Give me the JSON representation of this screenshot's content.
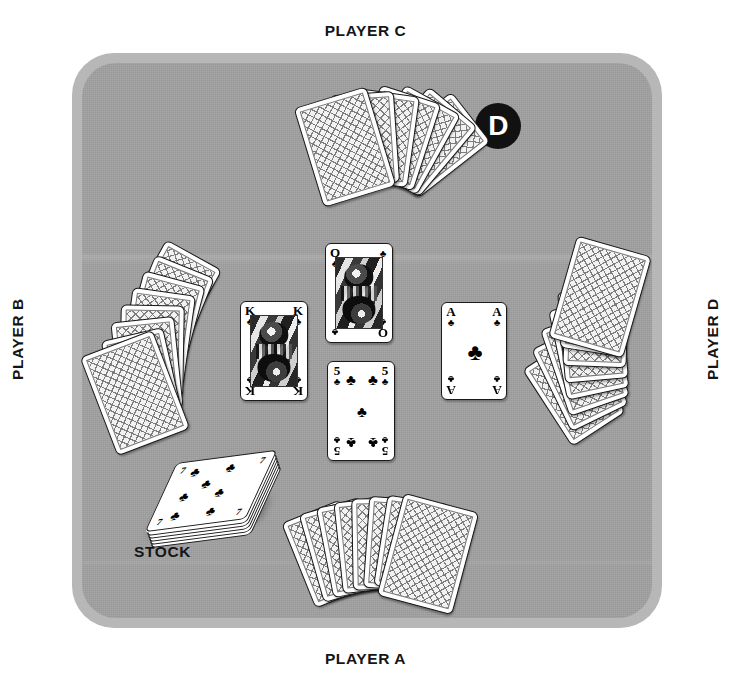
{
  "diagram": {
    "table_color": "#9e9e9e",
    "table_rim_color": "#b7b7b7",
    "accent_color": "#111111"
  },
  "labels": {
    "player_c": "PLAYER C",
    "player_a": "PLAYER A",
    "player_b": "PLAYER B",
    "player_d": "PLAYER D",
    "stock": "STOCK"
  },
  "dealer_button": {
    "letter": "D",
    "name": "dealer-button",
    "belongs_to": "PLAYER D"
  },
  "hands": [
    {
      "player": "PLAYER C",
      "position": "top",
      "card_count": 7,
      "face": "down"
    },
    {
      "player": "PLAYER B",
      "position": "left",
      "card_count": 8,
      "face": "down"
    },
    {
      "player": "PLAYER D",
      "position": "right",
      "card_count": 8,
      "face": "down"
    },
    {
      "player": "PLAYER A",
      "position": "bottom",
      "card_count": 8,
      "face": "down"
    }
  ],
  "trick": {
    "name": "center-trick",
    "cards": [
      {
        "slot": "top",
        "rank": "Q",
        "suit": "clubs",
        "suit_glyph": "♣",
        "label": "Q♣",
        "played_by": "PLAYER C"
      },
      {
        "slot": "left",
        "rank": "K",
        "suit": "clubs",
        "suit_glyph": "♣",
        "label": "K♣",
        "played_by": "PLAYER B"
      },
      {
        "slot": "right",
        "rank": "A",
        "suit": "clubs",
        "suit_glyph": "♣",
        "label": "A♣",
        "played_by": "PLAYER D"
      },
      {
        "slot": "bottom",
        "rank": "5",
        "suit": "clubs",
        "suit_glyph": "♣",
        "label": "5♣",
        "played_by": "PLAYER A"
      }
    ]
  },
  "stock": {
    "name": "stock-pile",
    "top_card": {
      "rank": "7",
      "suit": "clubs",
      "suit_glyph": "♣",
      "label": "7♣"
    },
    "face": "up",
    "caption": "STOCK"
  }
}
